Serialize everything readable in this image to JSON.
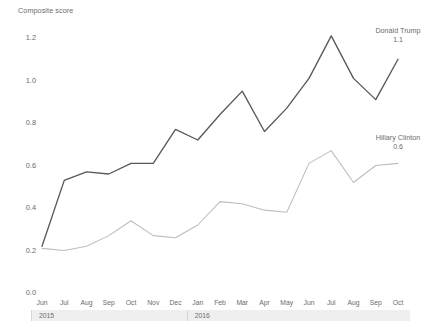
{
  "chart_data": {
    "type": "line",
    "title": "",
    "ylabel": "Composite score",
    "xlabel": "",
    "ylim": [
      0.0,
      1.2
    ],
    "yticks": [
      "0.0",
      "0.2",
      "0.4",
      "0.6",
      "0.8",
      "1.0",
      "1.2"
    ],
    "ytick_values": [
      0.0,
      0.2,
      0.4,
      0.6,
      0.8,
      1.0,
      1.2
    ],
    "grid": false,
    "legend_position": "inline-right",
    "categories": [
      "Jun",
      "Jul",
      "Aug",
      "Sep",
      "Oct",
      "Nov",
      "Dec",
      "Jan",
      "Feb",
      "Mar",
      "Apr",
      "May",
      "Jun",
      "Jul",
      "Aug",
      "Sep",
      "Oct"
    ],
    "year_groups": [
      {
        "label": "2015",
        "start_index": 0,
        "end_index": 6
      },
      {
        "label": "2016",
        "start_index": 7,
        "end_index": 16
      }
    ],
    "series": [
      {
        "name": "Donald Trump",
        "color": "#58595b",
        "end_value": "1.1",
        "values": [
          0.22,
          0.53,
          0.57,
          0.56,
          0.61,
          0.61,
          0.77,
          0.72,
          0.84,
          0.95,
          0.76,
          0.87,
          1.01,
          1.21,
          1.01,
          0.91,
          1.1
        ]
      },
      {
        "name": "Hillary Clinton",
        "color": "#bdbdbd",
        "end_value": "0.6",
        "values": [
          0.21,
          0.2,
          0.22,
          0.27,
          0.34,
          0.27,
          0.26,
          0.32,
          0.43,
          0.42,
          0.39,
          0.38,
          0.61,
          0.67,
          0.52,
          0.6,
          0.61
        ]
      }
    ]
  }
}
